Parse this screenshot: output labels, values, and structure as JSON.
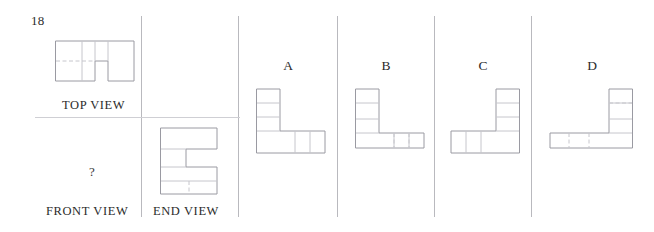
{
  "question": {
    "number": "18",
    "prompt_marker": "?"
  },
  "views": {
    "top_label": "TOP VIEW",
    "front_label": "FRONT VIEW",
    "end_label": "END VIEW"
  },
  "options": [
    {
      "letter": "A"
    },
    {
      "letter": "B"
    },
    {
      "letter": "C"
    },
    {
      "letter": "D"
    }
  ],
  "colors": {
    "outline": "#9a9aa2",
    "inner_line": "#c6c6cc",
    "rule": "#b9b9be",
    "text": "#2b2b2b",
    "background": "#ffffff"
  },
  "figures": {
    "top_view": {
      "name": "top-view-shape",
      "description": "rectangle with square notch removed from bottom edge",
      "cells_wide": 3,
      "cells_tall": 2
    },
    "end_view": {
      "name": "end-view-shape",
      "description": "C-shaped block, notch opening to the right",
      "cells_wide": 2,
      "cells_tall": 3
    },
    "option_a": {
      "name": "option-a-shape",
      "description": "L-shape, vertical arm on left rising up, horizontal foot extending right"
    },
    "option_b": {
      "name": "option-b-shape",
      "description": "L-shape, vertical arm on left, horizontal foot raised one cell"
    },
    "option_c": {
      "name": "option-c-shape",
      "description": "mirrored L-shape, vertical arm on right, horizontal foot extending left"
    },
    "option_d": {
      "name": "option-d-shape",
      "description": "mirrored L-shape, vertical arm on right, horizontal foot raised on left"
    }
  }
}
